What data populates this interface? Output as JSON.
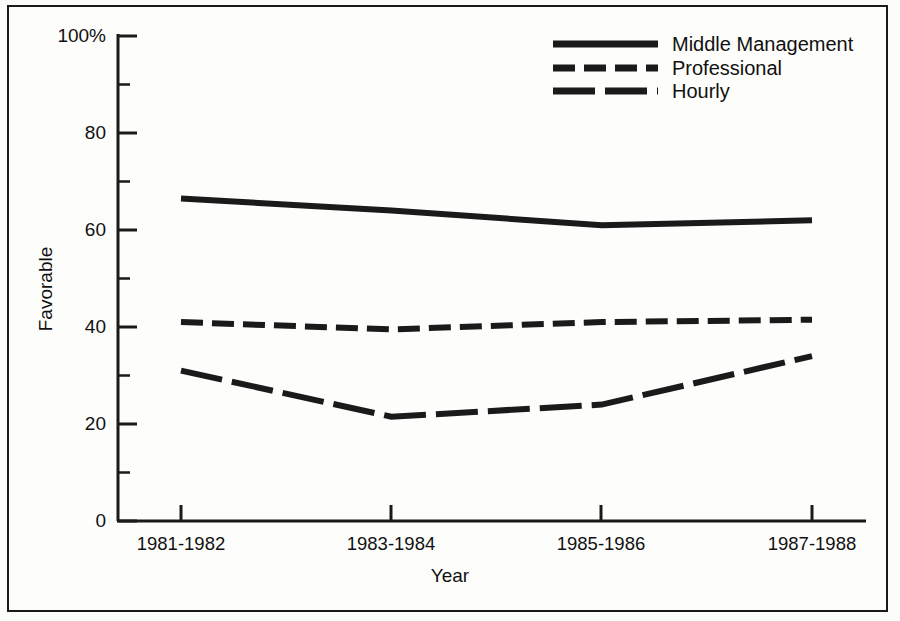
{
  "chart_data": {
    "type": "line",
    "title": "",
    "xlabel": "Year",
    "ylabel": "Favorable",
    "categories": [
      "1981-1982",
      "1983-1984",
      "1985-1986",
      "1987-1988"
    ],
    "ylim": [
      0,
      100
    ],
    "yticks": [
      0,
      20,
      40,
      60,
      80,
      100
    ],
    "ytick_labels": [
      "0",
      "20",
      "40",
      "60",
      "80",
      "100%"
    ],
    "minor_yticks": [
      10,
      30,
      50,
      70,
      90
    ],
    "grid": false,
    "legend_position": "top-right",
    "series": [
      {
        "name": "Middle Management",
        "style": "solid",
        "values": [
          66.5,
          64.0,
          61.0,
          62.0
        ]
      },
      {
        "name": "Professional",
        "style": "short-dash",
        "values": [
          41.0,
          39.5,
          41.0,
          41.5
        ]
      },
      {
        "name": "Hourly",
        "style": "long-dash",
        "values": [
          31.0,
          21.5,
          24.0,
          34.0
        ]
      }
    ]
  },
  "axis": {
    "y_label": "Favorable",
    "x_label": "Year",
    "y_tick_labels": [
      "100%",
      "80",
      "60",
      "40",
      "20",
      "0"
    ],
    "x_tick_labels": [
      "1981-1982",
      "1983-1984",
      "1985-1986",
      "1987-1988"
    ]
  },
  "legend": {
    "items": [
      {
        "label": "Middle Management",
        "style": "solid"
      },
      {
        "label": "Professional",
        "style": "short-dash"
      },
      {
        "label": "Hourly",
        "style": "long-dash"
      }
    ]
  },
  "colors": {
    "ink": "#1a1a1a",
    "paper": "#fdfdfb"
  }
}
